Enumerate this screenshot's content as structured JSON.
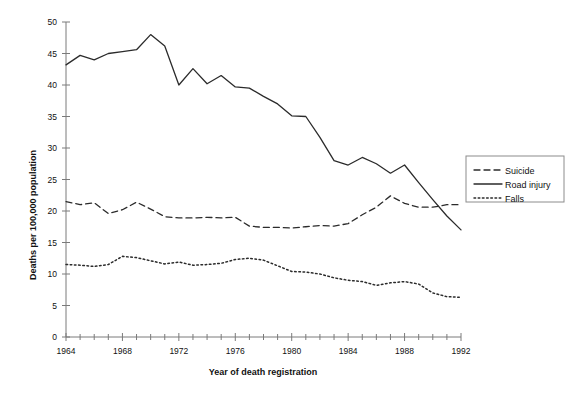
{
  "chart_data": {
    "type": "line",
    "title": "",
    "xlabel": "Year of death registration",
    "ylabel": "Deaths per 100,000 population",
    "xlim": [
      1964,
      1992
    ],
    "ylim": [
      0,
      50
    ],
    "grid": false,
    "legend_position": "right",
    "x": [
      1964,
      1965,
      1966,
      1967,
      1968,
      1969,
      1970,
      1971,
      1972,
      1973,
      1974,
      1975,
      1976,
      1977,
      1978,
      1979,
      1980,
      1981,
      1982,
      1983,
      1984,
      1985,
      1986,
      1987,
      1988,
      1989,
      1990,
      1991,
      1992
    ],
    "xticks": [
      1964,
      1968,
      1972,
      1976,
      1980,
      1984,
      1988,
      1992
    ],
    "xtick_labels": [
      "1964",
      "1968",
      "1972",
      "1976",
      "1980",
      "1984",
      "1988",
      "1992"
    ],
    "yticks": [
      0,
      5,
      10,
      15,
      20,
      25,
      30,
      35,
      40,
      45,
      50
    ],
    "ytick_labels": [
      "0",
      "5",
      "10",
      "15",
      "20",
      "25",
      "30",
      "35",
      "40",
      "45",
      "50"
    ],
    "series": [
      {
        "name": "Suicide",
        "style": "dashed",
        "color": "#2b2b2b",
        "values": [
          21.5,
          21.0,
          21.3,
          19.6,
          20.2,
          21.4,
          20.3,
          19.1,
          18.9,
          18.9,
          19.0,
          18.9,
          19.0,
          17.6,
          17.4,
          17.4,
          17.3,
          17.5,
          17.7,
          17.6,
          18.0,
          19.4,
          20.6,
          22.4,
          21.2,
          20.6,
          20.6,
          21.0,
          21.0
        ]
      },
      {
        "name": "Road injury",
        "style": "solid",
        "color": "#2b2b2b",
        "values": [
          43.2,
          44.7,
          44.0,
          45.0,
          45.3,
          45.6,
          48.0,
          46.2,
          40.0,
          42.6,
          40.2,
          41.5,
          39.7,
          39.5,
          38.2,
          37.0,
          35.1,
          35.0,
          31.7,
          28.0,
          27.3,
          28.5,
          27.5,
          26.0,
          27.3,
          24.5,
          21.8,
          19.2,
          17.0
        ]
      },
      {
        "name": "Falls",
        "style": "dotted",
        "color": "#2b2b2b",
        "values": [
          11.5,
          11.4,
          11.2,
          11.5,
          12.8,
          12.6,
          12.1,
          11.6,
          11.9,
          11.4,
          11.5,
          11.7,
          12.3,
          12.5,
          12.2,
          11.3,
          10.4,
          10.3,
          10.0,
          9.4,
          9.0,
          8.8,
          8.2,
          8.6,
          8.8,
          8.4,
          7.0,
          6.4,
          6.3
        ]
      }
    ]
  },
  "legend": {
    "items": [
      {
        "label": "Suicide",
        "style": "dashed"
      },
      {
        "label": "Road injury",
        "style": "solid"
      },
      {
        "label": "Falls",
        "style": "dotted"
      }
    ]
  }
}
